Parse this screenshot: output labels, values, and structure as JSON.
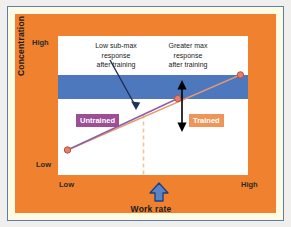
{
  "figure": {
    "background_color": "#f0822f",
    "frame_border_color": "#5b7fa6",
    "frame_inner_color": "#fdfbe4"
  },
  "axes": {
    "y_title": "Concentration",
    "y_ticks": [
      "High",
      "Low"
    ],
    "x_title": "Work rate",
    "x_ticks": [
      "Low",
      "High"
    ]
  },
  "annotations": {
    "sub_max": "Low sub-max\nresponse\nafter training",
    "max": "Greater max\nresponse\nafter training"
  },
  "legend": {
    "untrained": "Untrained",
    "untrained_color": "#9c4f96",
    "trained": "Trained",
    "trained_color": "#f0955a"
  },
  "icons": {
    "work_rate_marker": "up-arrow-icon",
    "max_response_marker": "double-headed-vertical-arrow-icon",
    "sub_max_pointer": "diagonal-arrow-icon"
  },
  "chart_data": {
    "type": "line",
    "title": "",
    "xlabel": "Work rate",
    "ylabel": "Concentration",
    "xlim": [
      0,
      100
    ],
    "ylim": [
      0,
      100
    ],
    "grid": false,
    "legend_position": "inside-plot",
    "max_response_band": {
      "label": "max response zone",
      "color": "#4e78bd",
      "y_range": [
        55,
        72
      ]
    },
    "reference_line": {
      "label": "sub-max work rate",
      "x": 45,
      "style": "dashed",
      "color": "#f3c39a"
    },
    "series": [
      {
        "name": "Untrained",
        "color": "#8a5fa8",
        "marker_color": "#e2806f",
        "x": [
          5,
          63
        ],
        "y": [
          18,
          55
        ]
      },
      {
        "name": "Trained",
        "color": "#e89a72",
        "marker_color": "#e2806f",
        "x": [
          5,
          96
        ],
        "y": [
          18,
          72
        ]
      }
    ]
  }
}
